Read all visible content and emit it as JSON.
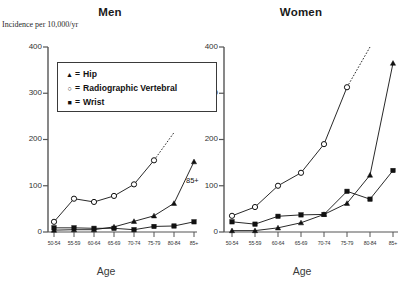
{
  "figure": {
    "y_axis_label": "Incidence per 10,000/yr",
    "x_axis_caption": "Age"
  },
  "legend": {
    "items": [
      {
        "marker": "triangle",
        "glyph": "▲",
        "equals": "=",
        "label": "Hip"
      },
      {
        "marker": "open-circle",
        "glyph": "○",
        "equals": "=",
        "label": "Radiographic Vertebral"
      },
      {
        "marker": "filled-square",
        "glyph": "■",
        "equals": "=",
        "label": "Wrist"
      }
    ]
  },
  "chart_data": [
    {
      "type": "line",
      "title": "Men",
      "xlabel": "Age",
      "ylabel": "Incidence per 10,000/yr",
      "ylim": [
        0,
        400
      ],
      "yticks": [
        0,
        100,
        200,
        300,
        400
      ],
      "categories": [
        "50-54",
        "55-59",
        "60-64",
        "65-69",
        "70-74",
        "75-79",
        "80-84",
        "85+"
      ],
      "grid": false,
      "legend_position": "upper-left-inset",
      "annotations": [
        {
          "text": "85+",
          "note": "label beside dotted extrapolation of Radiographic Vertebral curve"
        }
      ],
      "series": [
        {
          "name": "Hip",
          "marker": "triangle",
          "values": [
            4,
            5,
            5,
            11,
            23,
            35,
            62,
            152
          ]
        },
        {
          "name": "Radiographic Vertebral",
          "marker": "open-circle",
          "values": [
            22,
            72,
            65,
            78,
            103,
            155,
            null,
            null
          ],
          "extrapolated_dashed_to": 215
        },
        {
          "name": "Wrist",
          "marker": "filled-square",
          "values": [
            9,
            9,
            8,
            8,
            5,
            12,
            13,
            22
          ]
        }
      ]
    },
    {
      "type": "line",
      "title": "Women",
      "xlabel": "Age",
      "ylabel": "Incidence per 10,000/yr",
      "ylim": [
        0,
        400
      ],
      "yticks": [
        0,
        100,
        200,
        300,
        400
      ],
      "categories": [
        "50-54",
        "55-59",
        "60-64",
        "65-69",
        "70-74",
        "75-79",
        "80-84",
        "85+"
      ],
      "grid": false,
      "legend_position": "shared-with-men-panel",
      "annotations": [],
      "series": [
        {
          "name": "Hip",
          "marker": "triangle",
          "values": [
            3,
            3,
            9,
            20,
            38,
            62,
            123,
            365
          ]
        },
        {
          "name": "Radiographic Vertebral",
          "marker": "open-circle",
          "values": [
            35,
            54,
            100,
            128,
            190,
            313,
            null,
            null
          ],
          "extrapolated_dashed_to": 400
        },
        {
          "name": "Wrist",
          "marker": "filled-square",
          "values": [
            22,
            17,
            34,
            37,
            38,
            88,
            71,
            133
          ]
        }
      ]
    }
  ]
}
